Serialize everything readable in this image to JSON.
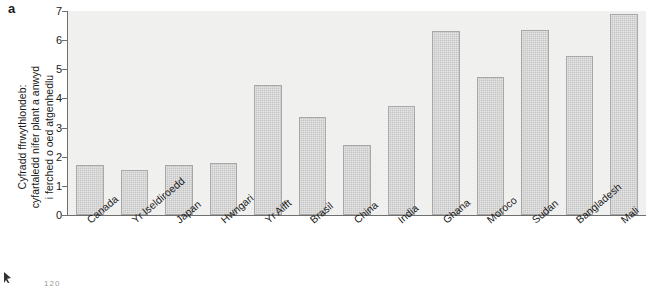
{
  "panel": {
    "label": "a"
  },
  "chart_data": {
    "type": "bar",
    "title": "",
    "subtitle": "",
    "xlabel": "",
    "ylabel": "Cyfradd ffrwythlondeb: cyfartaledd nifer plant a anwyd i ferched o oed atgenhedlu",
    "ylabel_lines": [
      "Cyfradd ffrwythlondeb:",
      "cyfartaledd nifer plant a anwyd",
      "i ferched o oed atgenhedlu"
    ],
    "ylim": [
      0,
      7
    ],
    "yticks": [
      0,
      1,
      2,
      3,
      4,
      5,
      6,
      7
    ],
    "ytick_labels": [
      "0",
      "1",
      "2",
      "3",
      "4",
      "5",
      "6",
      "7"
    ],
    "grid": false,
    "legend": null,
    "categories": [
      "Canada",
      "Yr Iseldiroedd",
      "Japan",
      "Hwngari",
      "Yr Aifft",
      "Brasil",
      "China",
      "India",
      "Ghana",
      "Moroco",
      "Sudan",
      "Bangladesh",
      "Mali"
    ],
    "values": [
      1.7,
      1.55,
      1.7,
      1.8,
      4.45,
      3.35,
      2.4,
      3.75,
      6.3,
      4.75,
      6.35,
      5.45,
      6.9
    ],
    "bar_color": "#c6c6c6",
    "bar_edge_color": "#a8a8a8",
    "plot_background": "#f0f0ef",
    "axis_color": "#6f6f6f"
  },
  "artifacts": {
    "page_number": "120"
  }
}
